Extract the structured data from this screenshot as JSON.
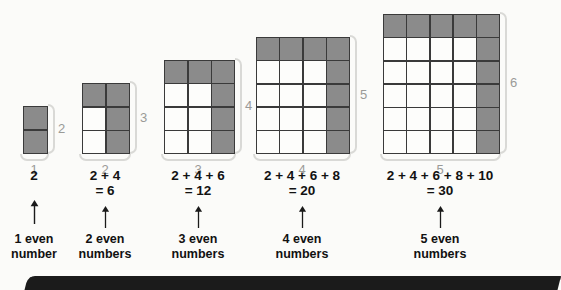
{
  "colors": {
    "background": "#fbfbf9",
    "shaded_cell": "#8b8b8b",
    "unshaded_cell": "#fdfdfb",
    "grid_line": "#3a3a3a",
    "brace": "#d9d9d6",
    "brace_label": "#9a9a97",
    "text": "#121212",
    "bottom_bar": "#1b1b1b"
  },
  "figures": [
    {
      "index": 1,
      "cols": 1,
      "rows": 2,
      "width_label": "1",
      "height_label": "2",
      "expression_line1": "2",
      "expression_line2": "",
      "caption_line1": "1 even",
      "caption_line2": "number",
      "sum": 2
    },
    {
      "index": 2,
      "cols": 2,
      "rows": 3,
      "width_label": "2",
      "height_label": "3",
      "expression_line1": "2 + 4",
      "expression_line2": "= 6",
      "caption_line1": "2 even",
      "caption_line2": "numbers",
      "sum": 6
    },
    {
      "index": 3,
      "cols": 3,
      "rows": 4,
      "width_label": "3",
      "height_label": "4",
      "expression_line1": "2 + 4 + 6",
      "expression_line2": "= 12",
      "caption_line1": "3 even",
      "caption_line2": "numbers",
      "sum": 12
    },
    {
      "index": 4,
      "cols": 4,
      "rows": 5,
      "width_label": "4",
      "height_label": "5",
      "expression_line1": "2 + 4 + 6 + 8",
      "expression_line2": "= 20",
      "caption_line1": "4 even",
      "caption_line2": "numbers",
      "sum": 20
    },
    {
      "index": 5,
      "cols": 5,
      "rows": 6,
      "width_label": "5",
      "height_label": "6",
      "expression_line1": "2 + 4 + 6 + 8 + 10",
      "expression_line2": "= 30",
      "caption_line1": "5 even",
      "caption_line2": "numbers",
      "sum": 30
    }
  ],
  "chart_data": {
    "type": "table",
    "categories": [
      "1 even number",
      "2 even numbers",
      "3 even numbers",
      "4 even numbers",
      "5 even numbers"
    ],
    "values": [
      2,
      6,
      12,
      20,
      30
    ],
    "expressions": [
      "2",
      "2 + 4 = 6",
      "2 + 4 + 6 = 12",
      "2 + 4 + 6 + 8 = 20",
      "2 + 4 + 6 + 8 + 10 = 30"
    ],
    "array_dimensions": [
      "1 x 2",
      "2 x 3",
      "3 x 4",
      "4 x 5",
      "5 x 6"
    ],
    "xlabel": "number of consecutive even numbers",
    "ylabel": "sum"
  }
}
